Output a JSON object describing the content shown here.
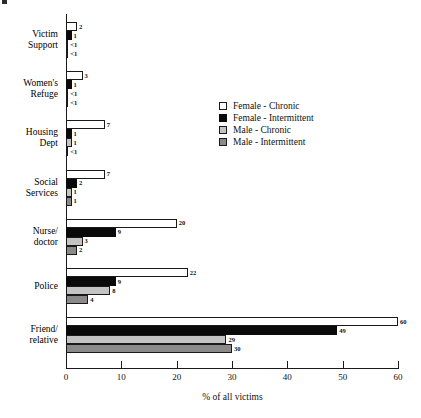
{
  "chart_data": {
    "type": "bar",
    "orientation": "horizontal",
    "title": "",
    "xlabel": "% of all victims",
    "ylabel": "",
    "xlim": [
      0,
      60
    ],
    "xticks": [
      0,
      10,
      20,
      30,
      40,
      50,
      60
    ],
    "xtick_labels": [
      "0",
      "10",
      "20",
      "30",
      "40",
      "50",
      "60"
    ],
    "grid": false,
    "legend_position": "center-right",
    "categories": [
      "Victim Support",
      "Women's Refuge",
      "Housing Dept",
      "Social Services",
      "Nurse/doctor",
      "Police",
      "Friend/relative"
    ],
    "category_lines": [
      [
        "Victim",
        "Support"
      ],
      [
        "Women's",
        "Refuge"
      ],
      [
        "Housing",
        "Dept"
      ],
      [
        "Social",
        "Services"
      ],
      [
        "Nurse/",
        "doctor"
      ],
      [
        "Police",
        ""
      ],
      [
        "Friend/",
        "relative"
      ]
    ],
    "series": [
      {
        "name": "Female - Chronic",
        "color": "#ffffff",
        "values": [
          2,
          3,
          7,
          7,
          20,
          22,
          60
        ],
        "labels": [
          "2",
          "3",
          "7",
          "7",
          "20",
          "22",
          "60"
        ]
      },
      {
        "name": "Female - Intermittent",
        "color": "#0a0a0a",
        "values": [
          1,
          1,
          1,
          2,
          9,
          9,
          49
        ],
        "labels": [
          "1",
          "1",
          "1",
          "2",
          "9",
          "9",
          "49"
        ]
      },
      {
        "name": "Male - Chronic",
        "color": "#c4c4c4",
        "values": [
          0.4,
          0.4,
          1,
          1,
          3,
          8,
          29
        ],
        "labels": [
          "<1",
          "<1",
          "1",
          "1",
          "3",
          "8",
          "29"
        ]
      },
      {
        "name": "Male - Intermittent",
        "color": "#8a8a8a",
        "values": [
          0.4,
          0.4,
          0.4,
          1,
          2,
          4,
          30
        ],
        "labels": [
          "<1",
          "<1",
          "<1",
          "1",
          "2",
          "4",
          "30"
        ]
      }
    ]
  },
  "legend": {
    "items": [
      {
        "label": "Female - Chronic",
        "swatch": "s0"
      },
      {
        "label": "Female - Intermittent",
        "swatch": "s1"
      },
      {
        "label": "Male - Chronic",
        "swatch": "s2"
      },
      {
        "label": "Male - Intermittent",
        "swatch": "s3"
      }
    ]
  }
}
